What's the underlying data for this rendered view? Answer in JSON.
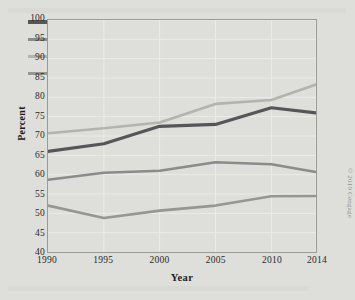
{
  "chart_data": {
    "type": "line",
    "title": "",
    "xlabel": "Year",
    "ylabel": "Percent",
    "categories": [
      "1990",
      "1995",
      "2000",
      "2005",
      "2010",
      "2014"
    ],
    "x": [
      1990,
      1995,
      2000,
      2005,
      2010,
      2014
    ],
    "xlim": [
      1990,
      2014
    ],
    "ylim": [
      40,
      100
    ],
    "ytick_step": 5,
    "yticks": [
      100,
      95,
      90,
      85,
      80,
      75,
      70,
      65,
      60,
      55,
      50,
      45,
      40
    ],
    "grid": true,
    "legend_position": "top-left",
    "series": [
      {
        "name": "White, non-Hispanic",
        "color": "#55555a",
        "values": [
          66.0,
          68.0,
          72.5,
          73.0,
          77.3,
          76.0
        ]
      },
      {
        "name": "Black",
        "color": "#8b8b8b",
        "values": [
          58.7,
          60.5,
          61.0,
          63.2,
          62.7,
          60.7
        ]
      },
      {
        "name": "Asian",
        "color": "#b4b4ae",
        "values": [
          70.7,
          72.0,
          73.5,
          78.3,
          79.3,
          83.3
        ]
      },
      {
        "name": "Hispanic",
        "color": "#979792",
        "values": [
          52.0,
          48.8,
          50.7,
          52.0,
          54.4,
          54.5
        ]
      }
    ]
  },
  "legend": {
    "items": [
      {
        "label": "White, non-Hispanic",
        "color": "#55555a"
      },
      {
        "label": "Black",
        "color": "#8b8b8b"
      },
      {
        "label": "Asian",
        "color": "#b4b4ae"
      },
      {
        "label": "Hispanic",
        "color": "#979792"
      }
    ]
  },
  "axes": {
    "y_title": "Percent",
    "x_title": "Year"
  },
  "footer": {
    "copyright": "© 2019 Cengage"
  },
  "colors": {
    "background": "#dededa",
    "frame": "#9a9a96",
    "gridline": "#ebebe7",
    "text": "#1d1d1b"
  }
}
